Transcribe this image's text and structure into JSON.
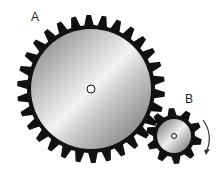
{
  "diagram": {
    "gear_a": {
      "label": "A",
      "teeth": 30
    },
    "gear_b": {
      "label": "B",
      "teeth": 10
    },
    "rotation_arrow": "clockwise-arrow"
  }
}
